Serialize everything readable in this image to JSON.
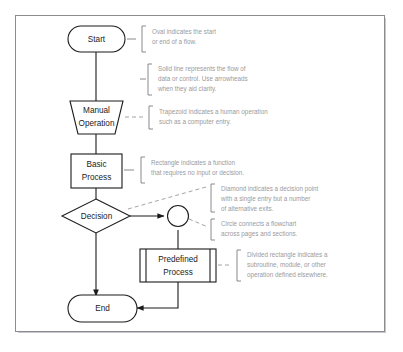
{
  "diagram": {
    "colors": {
      "stroke": "#1b1b1b",
      "note": "#9a9a9e",
      "frame": "#8c8c90",
      "background": "#ffffff"
    },
    "nodes": [
      {
        "id": "start",
        "shape": "oval",
        "label": "Start"
      },
      {
        "id": "manual",
        "shape": "trapezoid",
        "label_line1": "Manual",
        "label_line2": "Operation"
      },
      {
        "id": "process",
        "shape": "rectangle",
        "label_line1": "Basic",
        "label_line2": "Process"
      },
      {
        "id": "decision",
        "shape": "diamond",
        "label": "Decision"
      },
      {
        "id": "connector",
        "shape": "circle",
        "label": ""
      },
      {
        "id": "predefined",
        "shape": "divided-rectangle",
        "label_line1": "Predefined",
        "label_line2": "Process"
      },
      {
        "id": "end",
        "shape": "oval",
        "label": "End"
      }
    ],
    "annotations": [
      {
        "id": "note-oval",
        "target": "start",
        "lines": [
          "Oval indicates the start",
          "or end of a flow."
        ]
      },
      {
        "id": "note-line",
        "target": "flow-line",
        "lines": [
          "Solid line represents the flow of",
          "data or control. Use arrowheads",
          "when they aid clarity."
        ]
      },
      {
        "id": "note-trapezoid",
        "target": "manual",
        "lines": [
          "Trapezoid indicates a human operation",
          "such as a computer entry."
        ]
      },
      {
        "id": "note-rectangle",
        "target": "process",
        "lines": [
          "Rectangle indicates a function",
          "that requires no input or decision."
        ]
      },
      {
        "id": "note-diamond",
        "target": "decision",
        "lines": [
          "Diamond indicates a decision point",
          "with a single entry but a number",
          "of alternative exits."
        ]
      },
      {
        "id": "note-circle",
        "target": "connector",
        "lines": [
          "Circle connects a flowchart",
          "across pages and sections."
        ]
      },
      {
        "id": "note-predefined",
        "target": "predefined",
        "lines": [
          "Divided rectangle indicates a",
          "subroutine, module, or other",
          "operation defined elsewhere."
        ]
      }
    ]
  }
}
